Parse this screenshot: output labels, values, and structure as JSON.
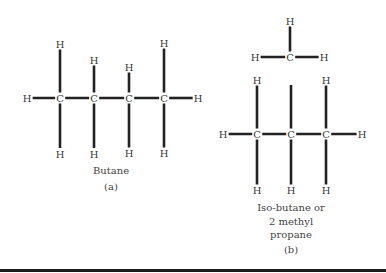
{
  "figure": {
    "panel_a": {
      "name": "Butane",
      "label": "(a)",
      "atoms": {
        "h_left": "H",
        "c1": "C",
        "c2": "C",
        "c3": "C",
        "c4": "C",
        "h_right": "H",
        "h1_top": "H",
        "h2_top": "H",
        "h3_top": "H",
        "h4_top": "H",
        "h1_bottom": "H",
        "h2_bottom": "H",
        "h3_bottom": "H",
        "h4_bottom": "H"
      }
    },
    "panel_b": {
      "name_line1": "Iso-butane or",
      "name_line2": "2 methyl",
      "name_line3": "propane",
      "label": "(b)",
      "atoms": {
        "methyl_c": "C",
        "methyl_h_top": "H",
        "methyl_h_left": "H",
        "methyl_h_right": "H",
        "h_left": "H",
        "c1": "C",
        "c2": "C",
        "c3": "C",
        "h_right": "H",
        "h1_top": "H",
        "h3_top": "H",
        "h1_bottom": "H",
        "h2_bottom": "H",
        "h3_bottom": "H"
      }
    },
    "colors": {
      "bond": "#222222",
      "text": "#3a3a3a",
      "rule": "#1c1c1c",
      "background": "#ffffff"
    }
  }
}
